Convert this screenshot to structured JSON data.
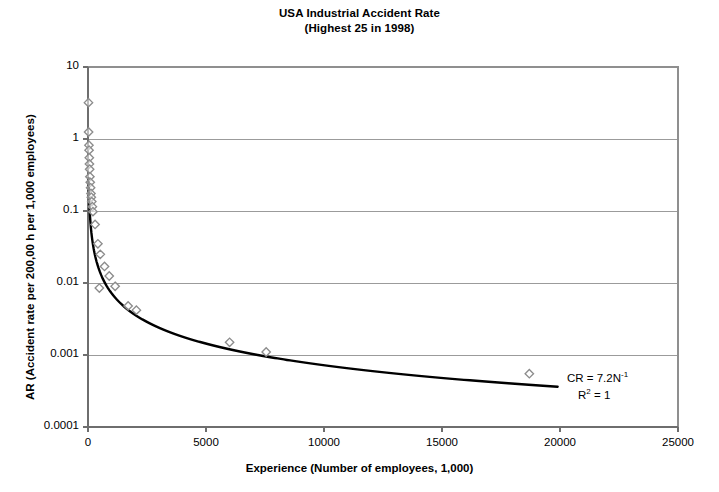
{
  "chart_data": {
    "type": "scatter",
    "title": "USA Industrial Accident Rate",
    "subtitle": "(Highest 25 in 1998)",
    "xlabel": "Experience (Number of employees, 1,000)",
    "ylabel": "AR (Accident rate per 200,00 h per 1,000 employees)",
    "xlim": [
      0,
      25000
    ],
    "ylim": [
      0.0001,
      10
    ],
    "yscale": "log",
    "xscale": "linear",
    "grid": "horizontal",
    "legend": "none",
    "xticks": [
      0,
      5000,
      10000,
      15000,
      20000,
      25000
    ],
    "xtick_labels": [
      "0",
      "5000",
      "10000",
      "15000",
      "20000",
      "25000"
    ],
    "yticks": [
      0.0001,
      0.001,
      0.01,
      0.1,
      1,
      10
    ],
    "ytick_labels": [
      "0.0001",
      "0.001",
      "0.01",
      "0.1",
      "1",
      "10"
    ],
    "marker": "open-diamond",
    "marker_color": "#8c8c8c",
    "points": [
      {
        "x": 20,
        "y": 3.2
      },
      {
        "x": 25,
        "y": 1.25
      },
      {
        "x": 40,
        "y": 0.82
      },
      {
        "x": 45,
        "y": 0.7
      },
      {
        "x": 55,
        "y": 0.55
      },
      {
        "x": 60,
        "y": 0.45
      },
      {
        "x": 70,
        "y": 0.38
      },
      {
        "x": 80,
        "y": 0.3
      },
      {
        "x": 95,
        "y": 0.25
      },
      {
        "x": 110,
        "y": 0.21
      },
      {
        "x": 125,
        "y": 0.175
      },
      {
        "x": 140,
        "y": 0.155
      },
      {
        "x": 160,
        "y": 0.135
      },
      {
        "x": 185,
        "y": 0.115
      },
      {
        "x": 210,
        "y": 0.098
      },
      {
        "x": 300,
        "y": 0.065
      },
      {
        "x": 420,
        "y": 0.035
      },
      {
        "x": 520,
        "y": 0.025
      },
      {
        "x": 700,
        "y": 0.017
      },
      {
        "x": 900,
        "y": 0.0125
      },
      {
        "x": 480,
        "y": 0.0085
      },
      {
        "x": 1150,
        "y": 0.009
      },
      {
        "x": 1700,
        "y": 0.0048
      },
      {
        "x": 2050,
        "y": 0.0042
      },
      {
        "x": 6000,
        "y": 0.0015
      },
      {
        "x": 7550,
        "y": 0.0011
      },
      {
        "x": 18700,
        "y": 0.00055
      }
    ],
    "fit_curve": {
      "equation_label": "CR = 7.2N",
      "equation_exponent": "-1",
      "r2_label": "R",
      "r2_exponent": "2",
      "r2_value": "= 1",
      "coefficient": 7.2,
      "exponent": -1,
      "color": "#000000",
      "x_start": 25,
      "x_end": 19900
    }
  }
}
